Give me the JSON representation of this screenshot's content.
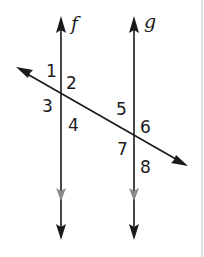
{
  "diagram": {
    "type": "parallel-lines-cut-by-transversal",
    "colors": {
      "line": "#1a1a1a",
      "parallel_marker": "#8a8a8a",
      "border": "#d8d8d8",
      "background": "#ffffff"
    },
    "lines": [
      {
        "id": "f",
        "label": "f",
        "x": 61
      },
      {
        "id": "g",
        "label": "g",
        "x": 134
      }
    ],
    "transversal": {
      "start": [
        17,
        68
      ],
      "end": [
        186,
        165
      ]
    },
    "angles": [
      {
        "label": "1",
        "x": 46,
        "y": 77
      },
      {
        "label": "2",
        "x": 66,
        "y": 89
      },
      {
        "label": "3",
        "x": 42,
        "y": 112
      },
      {
        "label": "4",
        "x": 68,
        "y": 131
      },
      {
        "label": "5",
        "x": 116,
        "y": 115
      },
      {
        "label": "6",
        "x": 140,
        "y": 133
      },
      {
        "label": "7",
        "x": 117,
        "y": 155
      },
      {
        "label": "8",
        "x": 140,
        "y": 173
      }
    ]
  }
}
